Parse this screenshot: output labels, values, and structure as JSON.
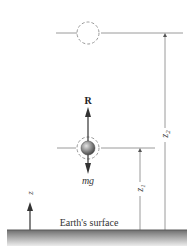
{
  "diagram": {
    "labels": {
      "normal_force": "R",
      "weight": "mg",
      "z_axis": "z",
      "height_1": "z",
      "height_1_sub": "1",
      "height_2": "z",
      "height_2_sub": "2",
      "ground": "Earth's surface"
    },
    "colors": {
      "line": "#9a9a9a",
      "arrow": "#333333",
      "ground_top": "#6e6e6e",
      "ground_bottom": "#e6e6e6",
      "ball_light": "#d8d8d8",
      "ball_dark": "#4a4a4a"
    }
  }
}
